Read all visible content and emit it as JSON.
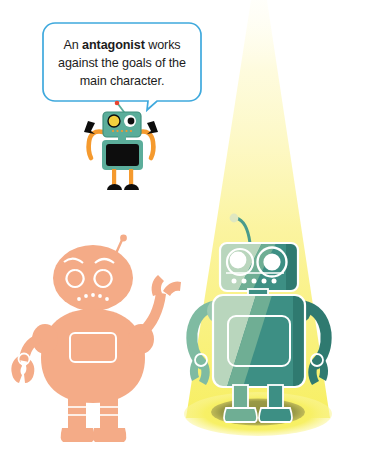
{
  "page": {
    "width": 368,
    "height": 469,
    "background": "#ffffff",
    "kind": "illustration"
  },
  "speech_bubble": {
    "name": "antagonist-definition-callout",
    "border_color": "#3fa9dd",
    "fill_color": "#ffffff",
    "text_color": "#1c1c1c",
    "line1_before": "An ",
    "line1_bold": "antagonist",
    "line1_after": " works",
    "line2": "against the goals of",
    "line3": "the main character.",
    "full_text": "An antagonist works against the goals of the main character."
  },
  "small_robot": {
    "name": "teal-speaker-robot",
    "head_color": "#5bad9a",
    "head_edge": "#3f8f7c",
    "body_color": "#5bad9a",
    "screen_color": "#0d0d0d",
    "limb_color": "#f59a2e",
    "hand_color": "#0d0d0d",
    "foot_color": "#0d0d0d",
    "eye_left_color": "#f2cf3e",
    "eye_right_color": "#ffffff",
    "pupil_color": "#0d0d0d",
    "antenna_color": "#5bad9a",
    "antenna_tip_color": "#e8452f",
    "mouth_dot_color": "#f59a2e"
  },
  "pink_robot": {
    "name": "antagonist-robot-silhouette",
    "body_color": "#f4ab87",
    "detail_color": "#ffffff",
    "expression": "angry"
  },
  "green_robot": {
    "name": "protagonist-robot-spotlit",
    "body_color": "#3d8f84",
    "body_lit_color": "#b9d6bd",
    "body_mid_color": "#6fae94",
    "outline_color": "#ffffff",
    "eye_color": "#ffffff",
    "eye_ring_color": "#ffffff",
    "dot_count": 5,
    "antenna_color": "#3d8f84",
    "antenna_tip_color": "#dfe7c0"
  },
  "spotlight": {
    "name": "stage-spotlight",
    "beam_color_top": "#fdf7b5",
    "beam_color_bottom": "#f9f06a",
    "pool_color": "#f6ee60",
    "shadow_color": "#9a9a43",
    "apex_x": 258,
    "apex_y": 0,
    "pool_center_y": 412
  }
}
